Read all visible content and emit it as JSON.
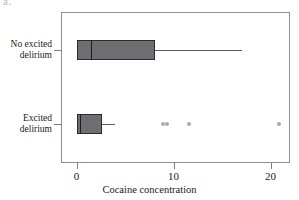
{
  "figure": {
    "panel_label": "a.",
    "background_color": "#ffffff",
    "frame_color": "#8d8d92",
    "box_fill_color": "#6e6e72",
    "box_edge_color": "#2b2b2e",
    "outlier_color": "#a9a9ae"
  },
  "chart_data": {
    "type": "box",
    "title": "",
    "xlabel": "Cocaine concentration",
    "ylabel": "",
    "xlim": [
      -1.6,
      22.0
    ],
    "xticks": [
      0,
      10,
      20
    ],
    "xticklabels": [
      "0",
      "10",
      "20"
    ],
    "grid": false,
    "legend": null,
    "orientation": "horizontal",
    "categories": [
      "No excited delirium",
      "Excited delirium"
    ],
    "boxes": [
      {
        "category": "No excited delirium",
        "label_lines": [
          "No excited",
          "delirium"
        ],
        "whisker_low": 0.0,
        "q1": 0.0,
        "median": 1.5,
        "q3": 8.1,
        "whisker_high": 17.1,
        "outliers": []
      },
      {
        "category": "Excited delirium",
        "label_lines": [
          "Excited",
          "delirium"
        ],
        "whisker_low": 0.0,
        "q1": 0.0,
        "median": 0.35,
        "q3": 2.6,
        "whisker_high": 4.0,
        "outliers": [
          8.9,
          9.3,
          11.6,
          20.9
        ]
      }
    ]
  }
}
